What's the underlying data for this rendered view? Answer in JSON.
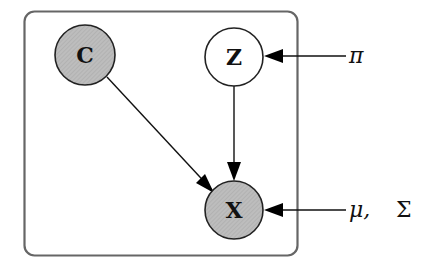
{
  "diagram": {
    "type": "probabilistic-graphical-model",
    "plate": {
      "label": ""
    },
    "nodes": [
      {
        "id": "C",
        "label": "C",
        "observed": true,
        "fill": "#bdbdbd"
      },
      {
        "id": "Z",
        "label": "Z",
        "observed": false,
        "fill": "#ffffff"
      },
      {
        "id": "X",
        "label": "X",
        "observed": true,
        "fill": "#bdbdbd"
      }
    ],
    "parameters": [
      {
        "id": "pi",
        "label": "π",
        "target": "Z"
      },
      {
        "id": "mu_sigma",
        "label_mu": "μ,",
        "label_sigma": "Σ",
        "target": "X"
      }
    ],
    "edges": [
      {
        "from": "C",
        "to": "X"
      },
      {
        "from": "Z",
        "to": "X"
      },
      {
        "from": "pi",
        "to": "Z"
      },
      {
        "from": "mu_sigma",
        "to": "X"
      }
    ]
  }
}
